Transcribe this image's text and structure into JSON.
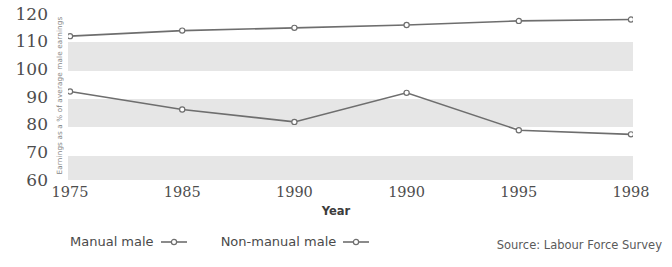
{
  "chart_data": {
    "type": "line",
    "title": "",
    "xlabel": "Year",
    "ylabel": "Earnings as a % of average male earnings",
    "categories": [
      "1975",
      "1985",
      "1990",
      "1990",
      "1995",
      "1998"
    ],
    "ylim": [
      60,
      120
    ],
    "yticks": [
      "120",
      "110",
      "100",
      "90",
      "80",
      "70",
      "60"
    ],
    "grid": false,
    "banding": "alternating horizontal grey bands every 10 units",
    "legend_position": "bottom-left",
    "series": [
      {
        "name": "Non-manual male",
        "values": [
          112,
          114,
          115,
          116,
          117.5,
          118
        ],
        "color": "#6e6e6e",
        "marker": "open-circle"
      },
      {
        "name": "Manual male",
        "values": [
          92,
          85.5,
          81,
          91.5,
          78,
          76.5
        ],
        "color": "#6e6e6e",
        "marker": "open-circle"
      }
    ],
    "source": "Source: Labour Force Survey"
  },
  "axis": {
    "y_title": "Earnings as a % of average male earnings",
    "x_title": "Year"
  },
  "legend": {
    "items": [
      {
        "label": "Manual male"
      },
      {
        "label": "Non-manual male"
      }
    ]
  },
  "footer": {
    "source": "Source: Labour Force Survey"
  },
  "colors": {
    "line": "#6e6e6e",
    "band": "#e6e6e6",
    "background": "#ffffff",
    "text": "#4a4a4a"
  }
}
